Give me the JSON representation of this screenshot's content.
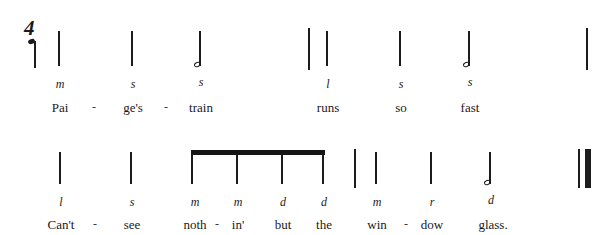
{
  "page": {
    "background_color": "#ffffff",
    "ink_color": "#1c1c1c",
    "notation_style": "stick-notation-with-solfege"
  },
  "time_signature": {
    "symbol": "4",
    "label": "four-beat-meter"
  },
  "pickup_note": {
    "solfege": "",
    "type": "quarter-note-with-notehead",
    "x": 33,
    "stem_top": 36,
    "stem_bottom": 68
  },
  "systems": [
    {
      "id": "system-1",
      "notes": [
        {
          "solfege": "m",
          "lyric": "Pai",
          "x": 58,
          "type": "stem",
          "stem_top": 31,
          "stem_bottom": 66
        },
        {
          "solfege": "s",
          "lyric": "ge's",
          "x": 131,
          "type": "stem",
          "stem_top": 31,
          "stem_bottom": 66
        },
        {
          "solfege": "s",
          "lyric": "train",
          "x": 199,
          "type": "stem-notehead",
          "stem_top": 31,
          "stem_bottom": 66
        },
        {
          "solfege": "l",
          "lyric": "runs",
          "x": 326,
          "type": "stem",
          "stem_top": 31,
          "stem_bottom": 66
        },
        {
          "solfege": "s",
          "lyric": "so",
          "x": 399,
          "type": "stem",
          "stem_top": 31,
          "stem_bottom": 66
        },
        {
          "solfege": "s",
          "lyric": "fast",
          "x": 468,
          "type": "stem-notehead",
          "stem_top": 31,
          "stem_bottom": 66
        }
      ],
      "hyphens": [
        {
          "x": 94,
          "mark": "-"
        },
        {
          "x": 166,
          "mark": "-"
        }
      ],
      "barlines": [
        {
          "x": 308,
          "kind": "single",
          "top": 28,
          "bottom": 70
        },
        {
          "x": 586,
          "kind": "single",
          "top": 28,
          "bottom": 70
        }
      ],
      "solfege_y": 78,
      "lyric_y": 101
    },
    {
      "id": "system-2",
      "notes": [
        {
          "solfege": "l",
          "lyric": "Can't",
          "x": 59,
          "type": "stem",
          "stem_top": 152,
          "stem_bottom": 184
        },
        {
          "solfege": "s",
          "lyric": "see",
          "x": 130,
          "type": "stem",
          "stem_top": 152,
          "stem_bottom": 184
        },
        {
          "solfege": "m",
          "lyric": "noth",
          "x": 193,
          "type": "beamed-eighth",
          "stem_top": 155,
          "stem_bottom": 184
        },
        {
          "solfege": "m",
          "lyric": "in'",
          "x": 236,
          "type": "beamed-eighth",
          "stem_top": 155,
          "stem_bottom": 184
        },
        {
          "solfege": "d",
          "lyric": "but",
          "x": 281,
          "type": "beamed-eighth",
          "stem_top": 155,
          "stem_bottom": 184
        },
        {
          "solfege": "d",
          "lyric": "the",
          "x": 322,
          "type": "beamed-eighth",
          "stem_top": 155,
          "stem_bottom": 184
        },
        {
          "solfege": "m",
          "lyric": "win",
          "x": 375,
          "type": "stem",
          "stem_top": 152,
          "stem_bottom": 184
        },
        {
          "solfege": "r",
          "lyric": "dow",
          "x": 430,
          "type": "stem",
          "stem_top": 152,
          "stem_bottom": 184
        },
        {
          "solfege": "d",
          "lyric": "glass.",
          "x": 489,
          "type": "stem-notehead",
          "stem_top": 152,
          "stem_bottom": 184
        }
      ],
      "hyphens": [
        {
          "x": 95,
          "mark": "-"
        },
        {
          "x": 215,
          "mark": "-"
        },
        {
          "x": 404,
          "mark": "-"
        }
      ],
      "beams": [
        {
          "x_start": 191,
          "x_end": 324,
          "y": 150
        }
      ],
      "barlines": [
        {
          "x": 354,
          "kind": "single",
          "top": 149,
          "bottom": 188
        },
        {
          "x": 580,
          "kind": "final-thin",
          "top": 149,
          "bottom": 188
        },
        {
          "x": 587,
          "kind": "final-thick",
          "top": 149,
          "bottom": 188
        }
      ],
      "solfege_y": 196,
      "lyric_y": 218
    }
  ]
}
